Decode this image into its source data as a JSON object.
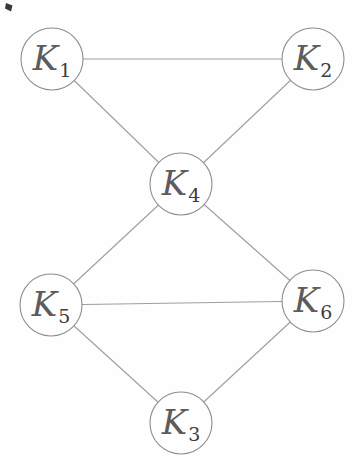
{
  "figure": {
    "kind": "undirected-graph-diagram",
    "background": "#fefefe",
    "edge_color": "#9e9e9e",
    "node_fill": "#fefefe",
    "node_stroke": "#8d8d8d",
    "label_color": "#5c5c5c",
    "subscript_color": "#3d3d3d",
    "width": 357,
    "height": 470
  },
  "graph": {
    "nodes": [
      {
        "id": "K1",
        "label_base": "K",
        "subscript": "1",
        "x": 52,
        "y": 59,
        "r": 31
      },
      {
        "id": "K2",
        "label_base": "K",
        "subscript": "2",
        "x": 313,
        "y": 59,
        "r": 31
      },
      {
        "id": "K4",
        "label_base": "K",
        "subscript": "4",
        "x": 181,
        "y": 184,
        "r": 31
      },
      {
        "id": "K5",
        "label_base": "K",
        "subscript": "5",
        "x": 51,
        "y": 305,
        "r": 31
      },
      {
        "id": "K6",
        "label_base": "K",
        "subscript": "6",
        "x": 313,
        "y": 301,
        "r": 31
      },
      {
        "id": "K3",
        "label_base": "K",
        "subscript": "3",
        "x": 181,
        "y": 423,
        "r": 31
      }
    ],
    "edges": [
      [
        "K1",
        "K2"
      ],
      [
        "K1",
        "K4"
      ],
      [
        "K2",
        "K4"
      ],
      [
        "K4",
        "K5"
      ],
      [
        "K4",
        "K6"
      ],
      [
        "K5",
        "K6"
      ],
      [
        "K5",
        "K3"
      ],
      [
        "K6",
        "K3"
      ]
    ]
  },
  "artifact": {
    "name": "ink-speck",
    "path": "M6 3 L12.5 5.5 L11 11.5 L5 8.5 Z",
    "color": "#3a3a3a"
  }
}
